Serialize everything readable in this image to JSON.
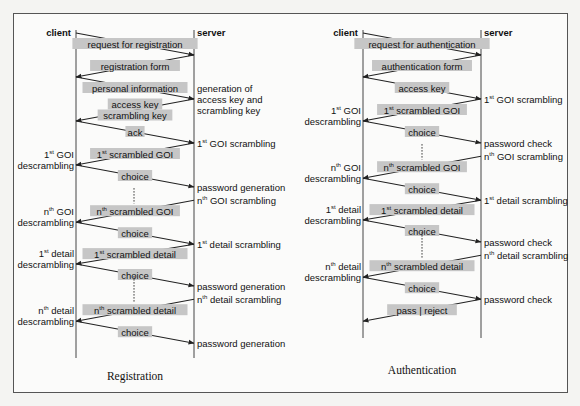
{
  "figure": {
    "panels": [
      {
        "id": "registration",
        "caption": "Registration",
        "client_label": "client",
        "server_label": "server",
        "messages": [
          {
            "dir": "c2s",
            "label": [
              "request for registration"
            ],
            "from_row": 0,
            "to_row": 1
          },
          {
            "dir": "s2c",
            "label": [
              "registration form"
            ],
            "from_row": 1,
            "to_row": 2
          },
          {
            "dir": "c2s",
            "label": [
              "personal information"
            ],
            "from_row": 2,
            "to_row": 3
          },
          {
            "dir": "s2c",
            "label": [
              "access key",
              "scrambling key"
            ],
            "from_row": 3,
            "to_row": 4
          },
          {
            "dir": "c2s",
            "label": [
              "ack"
            ],
            "from_row": 4,
            "to_row": 5
          },
          {
            "dir": "s2c",
            "label": [
              "1|st| scrambled GOI"
            ],
            "from_row": 5,
            "to_row": 6
          },
          {
            "dir": "c2s",
            "label": [
              "choice"
            ],
            "from_row": 6,
            "to_row": 7
          },
          {
            "dir": "s2c",
            "label": [
              "n|th| scrambled GOI"
            ],
            "from_row": 7.6,
            "to_row": 8.6
          },
          {
            "dir": "c2s",
            "label": [
              "choice"
            ],
            "from_row": 8.6,
            "to_row": 9.6
          },
          {
            "dir": "s2c",
            "label": [
              "1|st| scrambled detail"
            ],
            "from_row": 9.6,
            "to_row": 10.5
          },
          {
            "dir": "c2s",
            "label": [
              "choice"
            ],
            "from_row": 10.5,
            "to_row": 11.5
          },
          {
            "dir": "s2c",
            "label": [
              "n|th| scrambled detail"
            ],
            "from_row": 12.1,
            "to_row": 13.1
          },
          {
            "dir": "c2s",
            "label": [
              "choice"
            ],
            "from_row": 13.1,
            "to_row": 14.1
          }
        ],
        "dotted": [
          {
            "from_row": 7.05,
            "to_row": 7.75
          },
          {
            "from_row": 11.05,
            "to_row": 12.25
          }
        ],
        "server_notes": [
          {
            "row": 3,
            "lines": [
              "generation of",
              "access key and",
              "scrambling key"
            ]
          },
          {
            "row": 5,
            "lines": [
              "1|st| GOI scrambling"
            ]
          },
          {
            "row": 7,
            "lines": [
              "password generation"
            ]
          },
          {
            "row": 7.6,
            "lines": [
              "n|th| GOI scrambling"
            ]
          },
          {
            "row": 9.6,
            "lines": [
              "1|st| detail scrambling"
            ]
          },
          {
            "row": 11.5,
            "lines": [
              "password generation"
            ]
          },
          {
            "row": 12.1,
            "lines": [
              "n|th| detail scrambling"
            ]
          },
          {
            "row": 14.1,
            "lines": [
              "password generation"
            ]
          }
        ],
        "client_notes": [
          {
            "row": 6,
            "lines": [
              "1|st| GOI",
              "descrambling"
            ]
          },
          {
            "row": 8.6,
            "lines": [
              "n|th| GOI",
              "descrambling"
            ]
          },
          {
            "row": 10.5,
            "lines": [
              "1|st| detail",
              "descrambling"
            ]
          },
          {
            "row": 13.1,
            "lines": [
              "n|th| detail",
              "descrambling"
            ]
          }
        ]
      },
      {
        "id": "authentication",
        "caption": "Authentication",
        "client_label": "client",
        "server_label": "server",
        "messages": [
          {
            "dir": "c2s",
            "label": [
              "request for authentication"
            ],
            "from_row": 0,
            "to_row": 1
          },
          {
            "dir": "s2c",
            "label": [
              "authentication form"
            ],
            "from_row": 1,
            "to_row": 2
          },
          {
            "dir": "c2s",
            "label": [
              "access key"
            ],
            "from_row": 2,
            "to_row": 3
          },
          {
            "dir": "s2c",
            "label": [
              "1|st| scrambled GOI"
            ],
            "from_row": 3,
            "to_row": 4
          },
          {
            "dir": "c2s",
            "label": [
              "choice"
            ],
            "from_row": 4,
            "to_row": 5
          },
          {
            "dir": "s2c",
            "label": [
              "n|th| scrambled GOI"
            ],
            "from_row": 5.6,
            "to_row": 6.6
          },
          {
            "dir": "c2s",
            "label": [
              "choice"
            ],
            "from_row": 6.6,
            "to_row": 7.6
          },
          {
            "dir": "s2c",
            "label": [
              "1|st| scrambled detail"
            ],
            "from_row": 7.6,
            "to_row": 8.5
          },
          {
            "dir": "c2s",
            "label": [
              "choice"
            ],
            "from_row": 8.5,
            "to_row": 9.5
          },
          {
            "dir": "s2c",
            "label": [
              "n|th| scrambled detail"
            ],
            "from_row": 10.1,
            "to_row": 11.1
          },
          {
            "dir": "c2s",
            "label": [
              "choice"
            ],
            "from_row": 11.1,
            "to_row": 12.1
          },
          {
            "dir": "s2c",
            "label": [
              "pass | reject"
            ],
            "from_row": 12.1,
            "to_row": 13.1
          }
        ],
        "dotted": [
          {
            "from_row": 5.05,
            "to_row": 5.75
          },
          {
            "from_row": 9.05,
            "to_row": 10.25
          }
        ],
        "server_notes": [
          {
            "row": 3,
            "lines": [
              "1|st| GOI scrambling"
            ]
          },
          {
            "row": 5,
            "lines": [
              "password check"
            ]
          },
          {
            "row": 5.6,
            "lines": [
              "n|th| GOI scrambling"
            ]
          },
          {
            "row": 7.6,
            "lines": [
              "1|st| detail scrambling"
            ]
          },
          {
            "row": 9.5,
            "lines": [
              "password check"
            ]
          },
          {
            "row": 10.1,
            "lines": [
              "n|th| detail scrambling"
            ]
          },
          {
            "row": 12.1,
            "lines": [
              "password check"
            ]
          }
        ],
        "client_notes": [
          {
            "row": 4,
            "lines": [
              "1|st| GOI",
              "descrambling"
            ]
          },
          {
            "row": 6.6,
            "lines": [
              "n|th| GOI",
              "descrambling"
            ]
          },
          {
            "row": 8.5,
            "lines": [
              "1|st| detail",
              "descrambling"
            ]
          },
          {
            "row": 11.1,
            "lines": [
              "n|th| detail",
              "descrambling"
            ]
          }
        ]
      }
    ]
  },
  "colors": {
    "label_highlight": "#c6c6c6",
    "line": "#222222",
    "frame": "#555555"
  }
}
